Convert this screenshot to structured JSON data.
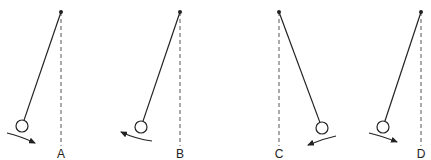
{
  "diagram": {
    "type": "pendulum-comparison",
    "colors": {
      "line": "#222222",
      "dashed": "#555555",
      "bob_fill": "#ffffff"
    },
    "pendulums": [
      {
        "label": "A",
        "pivot": [
          61,
          12
        ],
        "bob": [
          22,
          126
        ],
        "bob_r": 6,
        "dash_end": 146,
        "label_pos": [
          61,
          158
        ],
        "arrow": {
          "from": [
            7,
            133
          ],
          "to": [
            35,
            143
          ],
          "ctrl": [
            20,
            136
          ],
          "direction": "right"
        }
      },
      {
        "label": "B",
        "pivot": [
          180,
          12
        ],
        "bob": [
          141,
          127
        ],
        "bob_r": 6,
        "dash_end": 146,
        "label_pos": [
          180,
          158
        ],
        "arrow": {
          "from": [
            152,
            141
          ],
          "to": [
            121,
            132
          ],
          "ctrl": [
            136,
            139
          ],
          "direction": "left"
        }
      },
      {
        "label": "C",
        "pivot": [
          279,
          12
        ],
        "bob": [
          322,
          128
        ],
        "bob_r": 6,
        "dash_end": 146,
        "label_pos": [
          279,
          158
        ],
        "arrow": {
          "from": [
            336,
            136
          ],
          "to": [
            308,
            145
          ],
          "ctrl": [
            322,
            139
          ],
          "direction": "left"
        }
      },
      {
        "label": "D",
        "pivot": [
          421,
          12
        ],
        "bob": [
          383,
          127
        ],
        "bob_r": 6,
        "dash_end": 146,
        "label_pos": [
          421,
          158
        ],
        "arrow": {
          "from": [
            369,
            133
          ],
          "to": [
            397,
            142
          ],
          "ctrl": [
            382,
            136
          ],
          "direction": "right"
        }
      }
    ]
  }
}
